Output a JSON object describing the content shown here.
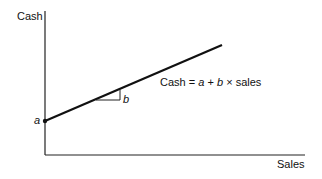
{
  "diagram": {
    "y_axis_label": "Cash",
    "x_axis_label": "Sales",
    "intercept_label": "a",
    "slope_label": "b",
    "equation": {
      "lhs": "Cash",
      "eq": "=",
      "a": "a",
      "plus": "+",
      "b": "b",
      "times": "×",
      "rhs": "sales"
    },
    "line_color": "#111111"
  }
}
